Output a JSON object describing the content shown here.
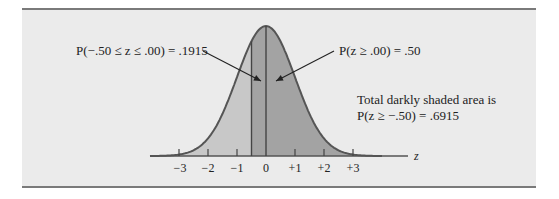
{
  "figure": {
    "annotations": {
      "left_prob": "P(−.50 ≤ z ≤ .00) = .1915",
      "right_prob": "P(z ≥ .00) = .50",
      "total_line1": "Total darkly shaded area is",
      "total_line2": "P(z ≥ −.50) = .6915"
    },
    "axis": {
      "label": "z",
      "ticks": [
        "−3",
        "−2",
        "−1",
        "0",
        "+1",
        "+2",
        "+3"
      ]
    },
    "colors": {
      "panel_bg": "#ebebeb",
      "light_shade": "#c8c8c8",
      "dark_shade": "#a3a3a3",
      "curve": "#555555",
      "border": "#7a7a7a"
    }
  }
}
